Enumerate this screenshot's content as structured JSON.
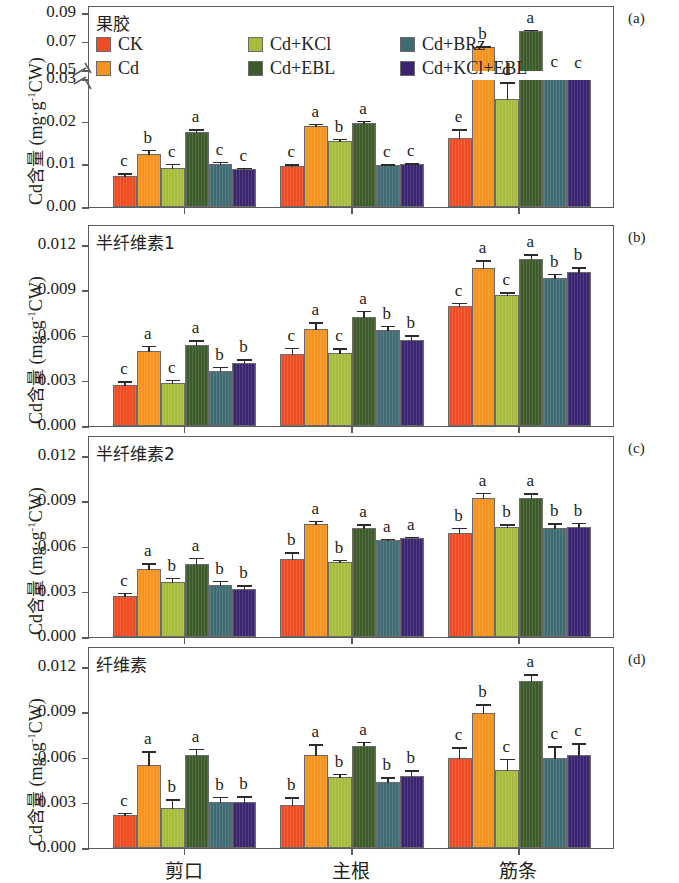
{
  "figure": {
    "y_axis_label_prefix": "Cd",
    "y_axis_label_cjk": "含量",
    "y_axis_label_unit": " (mg·g",
    "y_axis_label_sup": "-1",
    "y_axis_label_suffix": "CW)"
  },
  "legend": {
    "position": "top-left-panel-a",
    "items": [
      {
        "label": "CK",
        "color": "#f04c23"
      },
      {
        "label": "Cd",
        "color": "#f6921e"
      },
      {
        "label": "Cd+KCl",
        "color": "#a8bc3c"
      },
      {
        "label": "Cd+EBL",
        "color": "#3c5a2a"
      },
      {
        "label": "Cd+BRz",
        "color": "#3f6b72"
      },
      {
        "label": "Cd+KCl+EBL",
        "color": "#3a2470"
      }
    ]
  },
  "x_categories": [
    "剪口",
    "主根",
    "筋条"
  ],
  "chart_data": [
    {
      "type": "bar",
      "panel": "(a)",
      "title": "果胶",
      "ylabel": "Cd含量 (mg·g-1CW)",
      "xlabel": "",
      "categories": [
        "剪口",
        "主根",
        "筋条"
      ],
      "yticks": [
        0.0,
        0.01,
        0.02,
        0.03,
        0.05,
        0.07,
        0.09
      ],
      "ytick_labels": [
        "0.00",
        "0.01",
        "0.02",
        "0.03",
        "0.05",
        "0.07",
        "0.09"
      ],
      "ylim": [
        0.0,
        0.09
      ],
      "axis_break": {
        "below": 0.03,
        "above": 0.05
      },
      "grid": false,
      "series": [
        {
          "name": "CK",
          "values": [
            0.0073,
            0.0095,
            0.0161
          ],
          "errors": [
            0.0009,
            0.0008,
            0.0024
          ],
          "letters": [
            "c",
            "c",
            "e"
          ]
        },
        {
          "name": "Cd",
          "values": [
            0.0125,
            0.019,
            0.066
          ],
          "errors": [
            0.0011,
            0.0008,
            0.0012
          ],
          "letters": [
            "b",
            "a",
            "b"
          ]
        },
        {
          "name": "Cd+KCl",
          "values": [
            0.0091,
            0.0154,
            0.0253
          ],
          "errors": [
            0.0013,
            0.0008,
            0.0042
          ],
          "letters": [
            "c",
            "b",
            "d"
          ]
        },
        {
          "name": "Cd+EBL",
          "values": [
            0.0176,
            0.0198,
            0.0775
          ],
          "errors": [
            0.0008,
            0.0007,
            0.0014
          ],
          "letters": [
            "a",
            "a",
            "a"
          ]
        },
        {
          "name": "Cd+BRz",
          "values": [
            0.01,
            0.0099,
            0.0472
          ],
          "errors": [
            0.0008,
            0.0003,
            0.0007
          ],
          "letters": [
            "c",
            "c",
            "c"
          ]
        },
        {
          "name": "Cd+KCl+EBL",
          "values": [
            0.009,
            0.0101,
            0.0468
          ],
          "errors": [
            0.0004,
            0.0004,
            0.0006
          ],
          "letters": [
            "c",
            "c",
            "c"
          ]
        }
      ]
    },
    {
      "type": "bar",
      "panel": "(b)",
      "title": "半纤维素1",
      "ylabel": "Cd含量 (mg·g-1CW)",
      "xlabel": "",
      "categories": [
        "剪口",
        "主根",
        "筋条"
      ],
      "yticks": [
        0.0,
        0.003,
        0.006,
        0.009,
        0.012
      ],
      "ytick_labels": [
        "0.000",
        "0.003",
        "0.006",
        "0.009",
        "0.012"
      ],
      "ylim": [
        0.0,
        0.0132
      ],
      "grid": false,
      "series": [
        {
          "name": "CK",
          "values": [
            0.00275,
            0.0048,
            0.00795
          ],
          "errors": [
            0.0003,
            0.00045,
            0.0003
          ],
          "letters": [
            "c",
            "c",
            "c"
          ]
        },
        {
          "name": "Cd",
          "values": [
            0.00495,
            0.00645,
            0.0105
          ],
          "errors": [
            0.00045,
            0.0005,
            0.00055
          ],
          "letters": [
            "a",
            "a",
            "a"
          ]
        },
        {
          "name": "Cd+KCl",
          "values": [
            0.00283,
            0.00487,
            0.0087
          ],
          "errors": [
            0.0003,
            0.00035,
            0.00025
          ],
          "letters": [
            "c",
            "c",
            "c"
          ]
        },
        {
          "name": "Cd+EBL",
          "values": [
            0.00535,
            0.00725,
            0.0111
          ],
          "errors": [
            0.0004,
            0.00045,
            0.00035
          ],
          "letters": [
            "a",
            "a",
            "a"
          ]
        },
        {
          "name": "Cd+BRz",
          "values": [
            0.00365,
            0.0064,
            0.0098
          ],
          "errors": [
            0.00035,
            0.0003,
            0.00035
          ],
          "letters": [
            "b",
            "b",
            "b"
          ]
        },
        {
          "name": "Cd+KCl+EBL",
          "values": [
            0.0042,
            0.00573,
            0.0102
          ],
          "errors": [
            0.0003,
            0.00035,
            0.0004
          ],
          "letters": [
            "b",
            "b",
            "b"
          ]
        }
      ]
    },
    {
      "type": "bar",
      "panel": "(c)",
      "title": "半纤维素2",
      "ylabel": "Cd含量 (mg·g-1CW)",
      "xlabel": "",
      "categories": [
        "剪口",
        "主根",
        "筋条"
      ],
      "yticks": [
        0.0,
        0.003,
        0.006,
        0.009,
        0.012
      ],
      "ytick_labels": [
        "0.000",
        "0.003",
        "0.006",
        "0.009",
        "0.012"
      ],
      "ylim": [
        0.0,
        0.0132
      ],
      "grid": false,
      "series": [
        {
          "name": "CK",
          "values": [
            0.0027,
            0.00515,
            0.0069
          ],
          "errors": [
            0.0003,
            0.00055,
            0.0004
          ],
          "letters": [
            "c",
            "b",
            "b"
          ]
        },
        {
          "name": "Cd",
          "values": [
            0.0045,
            0.0075,
            0.0092
          ],
          "errors": [
            0.00045,
            0.00028,
            0.00045
          ],
          "letters": [
            "a",
            "a",
            "a"
          ]
        },
        {
          "name": "Cd+KCl",
          "values": [
            0.00365,
            0.00498,
            0.0073
          ],
          "errors": [
            0.00033,
            0.00022,
            0.00025
          ],
          "letters": [
            "b",
            "b",
            "b"
          ]
        },
        {
          "name": "Cd+EBL",
          "values": [
            0.00483,
            0.00725,
            0.0092
          ],
          "errors": [
            0.00048,
            0.0003,
            0.0004
          ],
          "letters": [
            "a",
            "a",
            "a"
          ]
        },
        {
          "name": "Cd+BRz",
          "values": [
            0.00345,
            0.00645,
            0.00725
          ],
          "errors": [
            0.00035,
            0.00015,
            0.00035
          ],
          "letters": [
            "b",
            "a",
            "b"
          ]
        },
        {
          "name": "Cd+KCl+EBL",
          "values": [
            0.0032,
            0.00655,
            0.00728
          ],
          "errors": [
            0.0003,
            0.00018,
            0.00035
          ],
          "letters": [
            "b",
            "a",
            "b"
          ]
        }
      ]
    },
    {
      "type": "bar",
      "panel": "(d)",
      "title": "纤维素",
      "ylabel": "Cd含量 (mg·g-1CW)",
      "xlabel": "",
      "categories": [
        "剪口",
        "主根",
        "筋条"
      ],
      "yticks": [
        0.0,
        0.003,
        0.006,
        0.009,
        0.012
      ],
      "ytick_labels": [
        "0.000",
        "0.003",
        "0.006",
        "0.009",
        "0.012"
      ],
      "ylim": [
        0.0,
        0.0132
      ],
      "grid": false,
      "series": [
        {
          "name": "CK",
          "values": [
            0.0022,
            0.00288,
            0.006
          ],
          "errors": [
            0.00022,
            0.00055,
            0.00075
          ],
          "letters": [
            "c",
            "b",
            "c"
          ]
        },
        {
          "name": "Cd",
          "values": [
            0.00548,
            0.0062,
            0.00895
          ],
          "errors": [
            0.001,
            0.00075,
            0.00065
          ],
          "letters": [
            "a",
            "a",
            "b"
          ]
        },
        {
          "name": "Cd+KCl",
          "values": [
            0.00265,
            0.00468,
            0.00518
          ],
          "errors": [
            0.00065,
            0.0003,
            0.0008
          ],
          "letters": [
            "b",
            "b",
            "c"
          ]
        },
        {
          "name": "Cd+EBL",
          "values": [
            0.00615,
            0.0068,
            0.01105
          ],
          "errors": [
            0.0005,
            0.0003,
            0.00055
          ],
          "letters": [
            "a",
            "a",
            "a"
          ]
        },
        {
          "name": "Cd+BRz",
          "values": [
            0.00303,
            0.00435,
            0.006
          ],
          "errors": [
            0.00045,
            0.0004,
            0.0008
          ],
          "letters": [
            "b",
            "b",
            "c"
          ]
        },
        {
          "name": "Cd+KCl+EBL",
          "values": [
            0.00305,
            0.00478,
            0.00615
          ],
          "errors": [
            0.00045,
            0.00045,
            0.00085
          ],
          "letters": [
            "b",
            "b",
            "c"
          ]
        }
      ]
    }
  ]
}
